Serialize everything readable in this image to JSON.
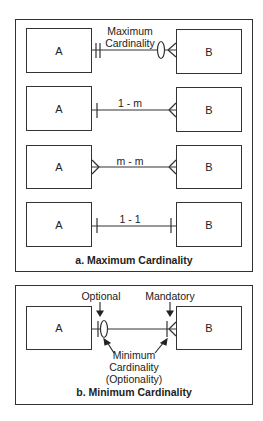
{
  "panel_a": {
    "caption": "a. Maximum Cardinality",
    "rows": [
      {
        "left_entity": "A",
        "right_entity": "B",
        "label_line1": "Maximum",
        "label_line2": "Cardinality",
        "left_symbol": "double-bar",
        "right_symbol": "circle-crows-foot"
      },
      {
        "left_entity": "A",
        "right_entity": "B",
        "label": "1 - m",
        "left_symbol": "bar",
        "right_symbol": "crows-foot"
      },
      {
        "left_entity": "A",
        "right_entity": "B",
        "label": "m - m",
        "left_symbol": "crows-foot",
        "right_symbol": "crows-foot"
      },
      {
        "left_entity": "A",
        "right_entity": "B",
        "label": "1 - 1",
        "left_symbol": "bar",
        "right_symbol": "bar"
      }
    ]
  },
  "panel_b": {
    "caption": "b. Minimum Cardinality",
    "left_entity": "A",
    "right_entity": "B",
    "optional_label": "Optional",
    "mandatory_label": "Mandatory",
    "annotation_line1": "Minimum",
    "annotation_line2": "Cardinality",
    "annotation_line3": "(Optionality)"
  },
  "colors": {
    "stroke": "#333333",
    "text": "#222222",
    "background": "#ffffff"
  }
}
